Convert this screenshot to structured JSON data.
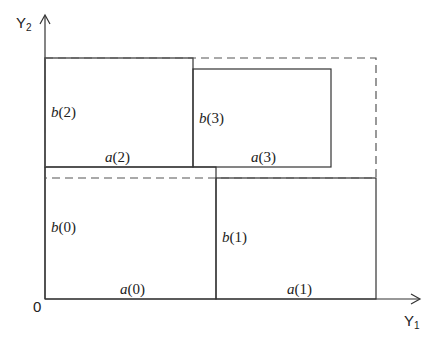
{
  "diagram": {
    "axes": {
      "x_label": "Y",
      "x_sub": "1",
      "y_label": "Y",
      "y_sub": "2",
      "origin": "0"
    },
    "rectangles": [
      {
        "id": 0,
        "width_label": "a(0)",
        "height_label": "b(0)",
        "style": "solid"
      },
      {
        "id": 1,
        "width_label": "a(1)",
        "height_label": "b(1)",
        "style": "solid"
      },
      {
        "id": 2,
        "width_label": "a(2)",
        "height_label": "b(2)",
        "style": "solid"
      },
      {
        "id": 3,
        "width_label": "a(3)",
        "height_label": "b(3)",
        "style": "solid"
      },
      {
        "id": "bounding",
        "style": "dashed"
      }
    ],
    "labels": {
      "a0_f": "a",
      "a0_n": "(0)",
      "b0_f": "b",
      "b0_n": "(0)",
      "a1_f": "a",
      "a1_n": "(1)",
      "b1_f": "b",
      "b1_n": "(1)",
      "a2_f": "a",
      "a2_n": "(2)",
      "b2_f": "b",
      "b2_n": "(2)",
      "a3_f": "a",
      "a3_n": "(3)",
      "b3_f": "b",
      "b3_n": "(3)"
    }
  }
}
